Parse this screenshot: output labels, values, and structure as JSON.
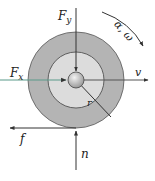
{
  "diagram": {
    "labels": {
      "fy": "F",
      "fy_sub": "y",
      "fx": "F",
      "fx_sub": "x",
      "v": "v",
      "r": "r",
      "f": "f",
      "n": "n",
      "alpha_omega": "α, ω"
    },
    "colors": {
      "outer_ring": "#b4b4b4",
      "inner_disk": "#dcdcdc",
      "hub": "#c8c8c8",
      "stroke": "#333333",
      "fx_arrow": "#5a9a8a",
      "background": "#ffffff"
    }
  }
}
